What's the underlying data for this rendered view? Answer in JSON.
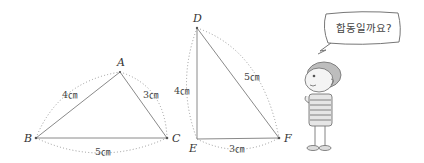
{
  "triangles": [
    {
      "name": "ABC",
      "vertices": [
        "A",
        "B",
        "C"
      ],
      "sides": [
        {
          "between": "AB",
          "length": "4㎝"
        },
        {
          "between": "AC",
          "length": "3㎝"
        },
        {
          "between": "BC",
          "length": "5㎝"
        }
      ]
    },
    {
      "name": "DEF",
      "vertices": [
        "D",
        "E",
        "F"
      ],
      "sides": [
        {
          "between": "DE",
          "length": "4㎝"
        },
        {
          "between": "DF",
          "length": "5㎝"
        },
        {
          "between": "EF",
          "length": "3㎝"
        }
      ]
    }
  ],
  "speech_bubble": {
    "text": "합동일까요?"
  },
  "colors": {
    "line": "#8a8a8a",
    "text": "#333333",
    "background": "#ffffff"
  }
}
